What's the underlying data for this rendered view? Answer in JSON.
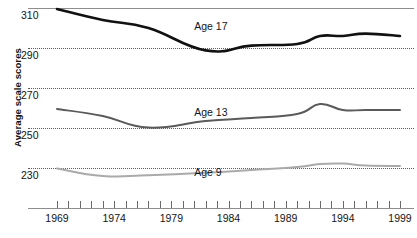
{
  "chart_data": {
    "type": "line",
    "title": "",
    "xlabel": "",
    "ylabel": "Average scale scores",
    "xlim": [
      1969,
      1999
    ],
    "ylim": [
      222,
      312
    ],
    "yticks": [
      310,
      290,
      270,
      250,
      230
    ],
    "ytick_labels": [
      "310",
      "290",
      "270",
      "250",
      "230"
    ],
    "xticks": [
      1969,
      1970,
      1971,
      1972,
      1973,
      1974,
      1975,
      1976,
      1977,
      1978,
      1979,
      1980,
      1981,
      1982,
      1983,
      1984,
      1985,
      1986,
      1987,
      1988,
      1989,
      1990,
      1991,
      1992,
      1993,
      1994,
      1995,
      1996,
      1997,
      1998,
      1999
    ],
    "xtick_labels": [
      "1969",
      "1974",
      "1979",
      "1984",
      "1989",
      "1994",
      "1999"
    ],
    "xtick_labelled_years": [
      1969,
      1974,
      1979,
      1984,
      1989,
      1994,
      1999
    ],
    "grid": "horizontal-dotted",
    "legend": "inline-series-labels",
    "series": [
      {
        "name": "Age 17",
        "color": "#111111",
        "width": 2.6,
        "label_x": 1981,
        "label_y": 301,
        "x": [
          1969,
          1973,
          1977,
          1982,
          1986,
          1990,
          1992,
          1994,
          1996,
          1999
        ],
        "values": [
          309.5,
          304,
          300,
          288.8,
          291.2,
          292,
          296,
          296,
          297.2,
          296
        ]
      },
      {
        "name": "Age 13",
        "color": "#5a5a5a",
        "width": 2.0,
        "label_x": 1981,
        "label_y": 258,
        "x": [
          1969,
          1973,
          1977,
          1982,
          1986,
          1990,
          1992,
          1994,
          1996,
          1999
        ],
        "values": [
          259.5,
          256,
          250.2,
          253.5,
          255,
          257,
          262,
          259,
          259,
          259
        ]
      },
      {
        "name": "Age 9",
        "color": "#aaaaaa",
        "width": 2.0,
        "label_x": 1981,
        "label_y": 228,
        "x": [
          1969,
          1973,
          1977,
          1982,
          1986,
          1990,
          1992,
          1994,
          1996,
          1999
        ],
        "values": [
          229.8,
          226,
          226.4,
          227.6,
          229,
          230.5,
          232,
          232.2,
          231.2,
          231
        ]
      }
    ]
  }
}
